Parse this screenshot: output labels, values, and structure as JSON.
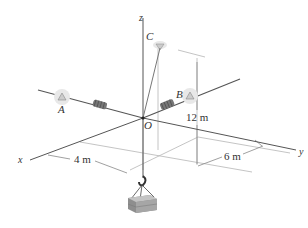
{
  "diagram": {
    "type": "3d-statics-figure",
    "axes": {
      "x": "x",
      "y": "y",
      "z": "z"
    },
    "points": {
      "origin": "O",
      "A": "A",
      "B": "B",
      "C": "C"
    },
    "dimensions": {
      "x_distance": "4 m",
      "y_distance": "6 m",
      "height": "12 m"
    },
    "elements": [
      "spring OA",
      "spring OB",
      "cable OC",
      "hanging crate"
    ],
    "colors": {
      "line": "#555555",
      "axis": "#444444",
      "dim": "#999999",
      "crate": "#9a9a9a"
    }
  }
}
